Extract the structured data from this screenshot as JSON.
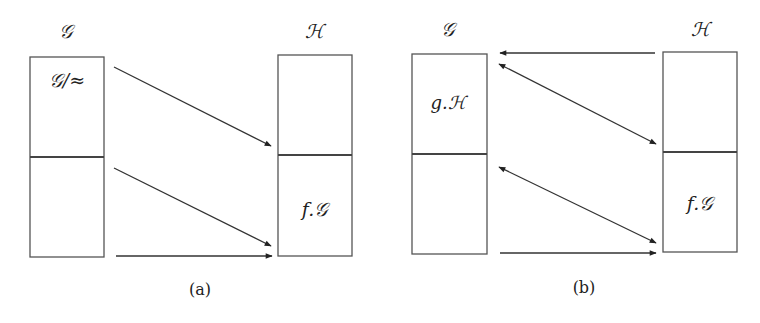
{
  "panels": [
    {
      "caption": "(a)",
      "left_set": {
        "title": "𝒢",
        "top_label": "𝒢/≈",
        "bottom_label": ""
      },
      "right_set": {
        "title": "ℋ",
        "top_label": "",
        "bottom_label": "f.𝒢"
      },
      "arrows": [
        {
          "from": "G top",
          "to": "H divider",
          "type": "single"
        },
        {
          "from": "G divider",
          "to": "H bottom",
          "type": "single"
        },
        {
          "from": "G bottom",
          "to": "H bottom",
          "type": "single-horizontal"
        }
      ]
    },
    {
      "caption": "(b)",
      "left_set": {
        "title": "𝒢",
        "top_label": "g.ℋ",
        "bottom_label": ""
      },
      "right_set": {
        "title": "ℋ",
        "top_label": "",
        "bottom_label": "f.𝒢"
      },
      "arrows": [
        {
          "from": "H top",
          "to": "G top",
          "type": "single-horizontal"
        },
        {
          "from": "G top",
          "to": "H divider",
          "type": "double"
        },
        {
          "from": "G divider",
          "to": "H bottom",
          "type": "double"
        },
        {
          "from": "G bottom",
          "to": "H bottom",
          "type": "single-horizontal"
        }
      ]
    }
  ]
}
